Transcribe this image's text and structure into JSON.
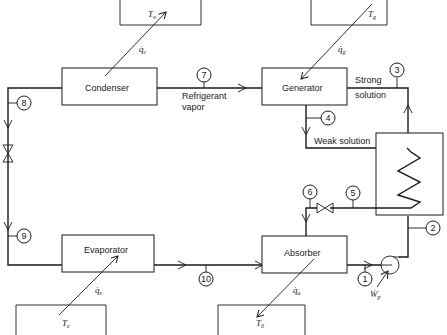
{
  "diagram": {
    "type": "absorption-refrigeration-cycle",
    "components": {
      "condenser": "Condenser",
      "generator": "Generator",
      "evaporator": "Evaporator",
      "absorber": "Absorber"
    },
    "reservoirs": {
      "top_left": "T",
      "top_left_sub": "o",
      "top_right": "T",
      "top_right_sub": "g",
      "bottom_left": "T",
      "bottom_left_sub": "e",
      "bottom_right": "T",
      "bottom_right_sub": "0"
    },
    "heat_flows": {
      "condenser": "q̇",
      "condenser_sub": "c",
      "generator": "q̇",
      "generator_sub": "g",
      "evaporator": "q̇",
      "evaporator_sub": "e",
      "absorber": "q̇",
      "absorber_sub": "a",
      "pump_work": "Ẇ",
      "pump_work_sub": "p"
    },
    "stream_labels": {
      "refrigerant_vapor_1": "Refrigerant",
      "refrigerant_vapor_2": "vapor",
      "strong_solution_1": "Strong",
      "strong_solution_2": "solution",
      "weak_solution": "Weak solution"
    },
    "state_points": [
      "1",
      "2",
      "3",
      "4",
      "5",
      "6",
      "7",
      "8",
      "9",
      "10"
    ]
  }
}
